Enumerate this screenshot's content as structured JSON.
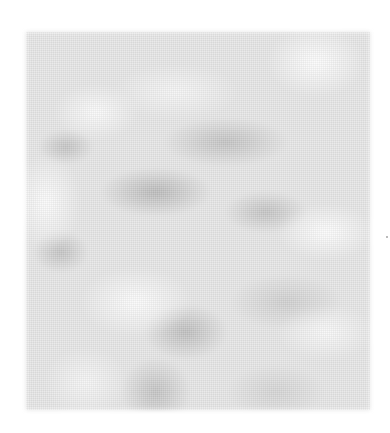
{
  "image": {
    "description": "Grayscale blurred cloud-like texture",
    "colors": {
      "base": "#e6e6e6",
      "dark": "#a0a0a0",
      "light": "#ffffff",
      "page": "#ffffff"
    }
  }
}
